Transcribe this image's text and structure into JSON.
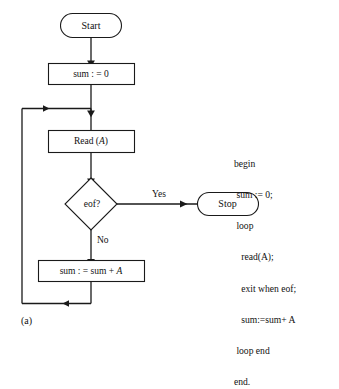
{
  "figure": {
    "caption": "(a)",
    "type": "flowchart"
  },
  "flowchart": {
    "nodes": {
      "start": {
        "label": "Start",
        "shape": "terminator"
      },
      "init": {
        "label": "sum : = 0",
        "shape": "process"
      },
      "read": {
        "label_prefix": "Read (",
        "label_var": "A",
        "label_suffix": ")",
        "shape": "process"
      },
      "decision": {
        "label": "eof?",
        "shape": "decision"
      },
      "stop": {
        "label": "Stop",
        "shape": "terminator"
      },
      "accumulate": {
        "label_prefix": "sum : = sum + ",
        "label_var": "A",
        "shape": "process"
      }
    },
    "branches": {
      "yes": "Yes",
      "no": "No"
    }
  },
  "pseudocode": {
    "lines": [
      "begin",
      " sum := 0;",
      " loop",
      "   read(A);",
      "   exit when eof;",
      "   sum:=sum+ A",
      " loop end",
      "end."
    ],
    "line_0": "begin",
    "line_1": " sum := 0;",
    "line_2": " loop",
    "line_3": "   read(A);",
    "line_4": "   exit when eof;",
    "line_5": "   sum:=sum+ A",
    "line_6": " loop end",
    "line_7": "end."
  },
  "colors": {
    "stroke": "#1a1a1a",
    "text": "#111111",
    "background": "#ffffff"
  }
}
